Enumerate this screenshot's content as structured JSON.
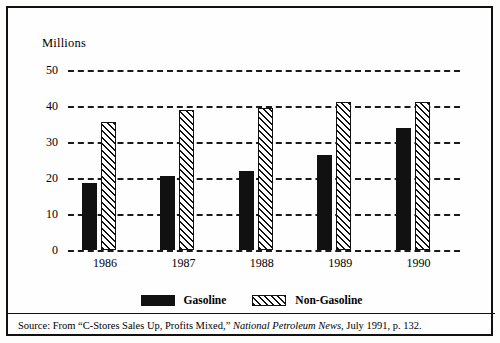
{
  "chart_data": {
    "type": "bar",
    "title": "",
    "subtitle": "",
    "ylabel": "Millions",
    "xlabel": "",
    "categories": [
      "1986",
      "1987",
      "1988",
      "1989",
      "1990"
    ],
    "series": [
      {
        "name": "Gasoline",
        "values": [
          18.5,
          20.5,
          22,
          26.5,
          34
        ],
        "fill": "solid-black",
        "color": "#111111"
      },
      {
        "name": "Non-Gasoline",
        "values": [
          35.5,
          39,
          39.5,
          41,
          41
        ],
        "fill": "diagonal-hatch",
        "color": "#111111"
      }
    ],
    "ylim": [
      0,
      50
    ],
    "yticks": [
      0,
      10,
      20,
      30,
      40,
      50
    ],
    "ytick_labels": [
      "0",
      "10",
      "20",
      "30",
      "40",
      "50"
    ],
    "grid": true,
    "grid_style": "dashed-horizontal",
    "legend_position": "bottom-center"
  },
  "axis": {
    "y_title": "Millions",
    "ticks": [
      {
        "label": "50",
        "value": 50
      },
      {
        "label": "40",
        "value": 40
      },
      {
        "label": "30",
        "value": 30
      },
      {
        "label": "20",
        "value": 20
      },
      {
        "label": "10",
        "value": 10
      },
      {
        "label": "0",
        "value": 0
      }
    ]
  },
  "legend": {
    "items": [
      {
        "label": "Gasoline",
        "swatch": "solid"
      },
      {
        "label": "Non-Gasoline",
        "swatch": "hatched"
      }
    ]
  },
  "source": {
    "prefix": "Source:  From “C-Stores Sales Up, Profits Mixed,” ",
    "publication": "National Petroleum News",
    "suffix": ", July 1991, p. 132."
  },
  "colors": {
    "ink": "#111111",
    "background": "#fefefe"
  }
}
